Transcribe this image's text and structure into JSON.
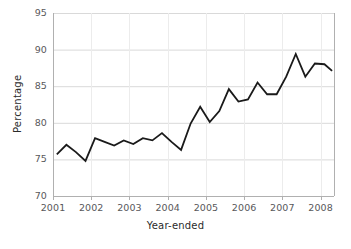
{
  "chart_data": {
    "type": "line",
    "title": "",
    "xlabel": "Year-ended",
    "ylabel": "Percentage",
    "ylim": [
      70,
      95
    ],
    "yticks": [
      70,
      75,
      80,
      85,
      90,
      95
    ],
    "xlim": [
      2001.0,
      2008.35
    ],
    "xticks": [
      2001,
      2002,
      2003,
      2004,
      2005,
      2006,
      2007,
      2008
    ],
    "xtick_labels": [
      "2001",
      "2002",
      "2003",
      "2004",
      "2005",
      "2006",
      "2007",
      "2008"
    ],
    "ytick_labels": [
      "70",
      "75",
      "80",
      "85",
      "90",
      "95"
    ],
    "grid": "horizontal",
    "legend": "none",
    "line_color": "#1a1a1a",
    "line_width": 1.8,
    "grid_color": "#d9d9d9",
    "axis_color": "#b0b0b0",
    "tick_label_color": "#58585a",
    "axis_title_color": "#2b2b2b",
    "background": "#ffffff",
    "series": [
      {
        "name": "Percentage",
        "x": [
          2001.1,
          2001.35,
          2001.6,
          2001.85,
          2002.1,
          2002.35,
          2002.6,
          2002.85,
          2003.1,
          2003.35,
          2003.6,
          2003.85,
          2004.1,
          2004.35,
          2004.6,
          2004.85,
          2005.1,
          2005.35,
          2005.6,
          2005.85,
          2006.1,
          2006.35,
          2006.6,
          2006.85,
          2007.1,
          2007.35,
          2007.6,
          2007.85,
          2008.1,
          2008.3
        ],
        "values": [
          75.7,
          77.0,
          76.0,
          74.8,
          77.9,
          77.4,
          76.9,
          77.6,
          77.1,
          77.9,
          77.6,
          78.6,
          77.4,
          76.3,
          79.9,
          82.2,
          80.1,
          81.6,
          84.6,
          82.9,
          83.2,
          85.5,
          83.9,
          83.9,
          86.3,
          89.4,
          86.3,
          88.1,
          88.0,
          87.1
        ]
      }
    ]
  }
}
